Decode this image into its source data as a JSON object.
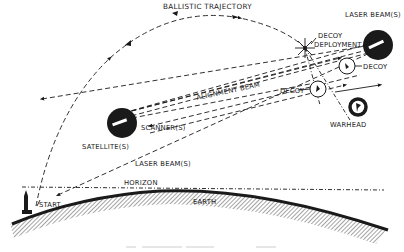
{
  "diagram": {
    "labels": {
      "ballistic_trajectory": "BALLISTIC TRAJECTORY",
      "laser_beam_top": "LASER BEAM(S)",
      "decoy_deployment_1": "DECOY",
      "decoy_deployment_2": "DEPLOYMENT",
      "decoy_right": "DECOY",
      "decoy_center": "DECOY",
      "alignment_beam": "ALIGNMENT BEAM",
      "scanner": "SCANNER(S)",
      "satellite": "SATELLITE(S)",
      "warhead": "WARHEAD",
      "laser_beam_bottom": "LASER BEAM(S)",
      "horizon": "HORIZON",
      "start": "START",
      "earth": "EARTH"
    },
    "colors": {
      "ink": "#1a1a1a",
      "background": "#ffffff",
      "caption": "#e6e6e6"
    }
  }
}
